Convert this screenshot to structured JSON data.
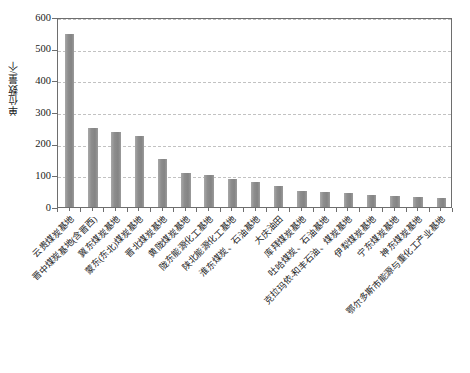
{
  "chart_data": {
    "type": "bar",
    "title": "",
    "subtitle": "",
    "xlabel": "",
    "ylabel": "单位数量/个",
    "ylim": [
      0,
      600
    ],
    "yticks": [
      0,
      100,
      200,
      300,
      400,
      500,
      600
    ],
    "ytick_labels": [
      "0",
      "100",
      "200",
      "300",
      "400",
      "500",
      "600"
    ],
    "grid": "horizontal-dashed",
    "legend": null,
    "bar_color": "#8d8d8d",
    "categories": [
      "云贵煤炭基地",
      "晋中煤炭基地(含晋西)",
      "冀东煤炭基地",
      "蒙东(东北)煤炭基地",
      "晋北煤炭基地",
      "黄陇煤炭基地",
      "陇东能源化工基地",
      "陕北能源化工基地",
      "淮东煤炭、石油基地",
      "大庆油田",
      "库拜煤炭基地",
      "吐哈煤炭、石油基地",
      "克拉玛依-和丰石油、煤炭基地",
      "伊犁煤炭基地",
      "宁东煤炭基地",
      "神东煤炭基地",
      "鄂尔多斯市能源与重化工产业基地"
    ],
    "values": [
      547,
      250,
      236,
      225,
      152,
      107,
      101,
      88,
      80,
      66,
      50,
      48,
      45,
      38,
      35,
      33,
      27
    ]
  },
  "caption": {
    "text": ""
  }
}
